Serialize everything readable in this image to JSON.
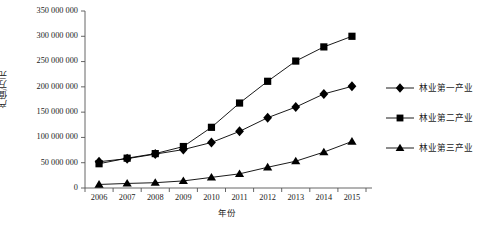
{
  "chart_data": {
    "type": "line",
    "title": "",
    "subtitle": "",
    "xlabel": "年份",
    "ylabel": "产值/万元",
    "categories": [
      "2006",
      "2007",
      "2008",
      "2009",
      "2010",
      "2011",
      "2012",
      "2013",
      "2014",
      "2015"
    ],
    "x": [
      2006,
      2007,
      2008,
      2009,
      2010,
      2011,
      2012,
      2013,
      2014,
      2015
    ],
    "xlim": [
      2005.5,
      2015.5
    ],
    "ylim": [
      0,
      350000000
    ],
    "ytick_values": [
      0,
      50000000,
      100000000,
      150000000,
      200000000,
      250000000,
      300000000,
      350000000
    ],
    "ytick_labels": [
      "0",
      "50 000 000",
      "100 000 000",
      "150 000 000",
      "200 000 000",
      "250 000 000",
      "300 000 000",
      "350 000 000"
    ],
    "grid": false,
    "legend_position": "right",
    "series": [
      {
        "name": "林业第一产业",
        "marker": "diamond",
        "color": "#000000",
        "values": [
          52000000,
          58000000,
          67000000,
          76000000,
          90000000,
          112000000,
          139000000,
          160000000,
          186000000,
          201000000
        ]
      },
      {
        "name": "林业第二产业",
        "marker": "square",
        "color": "#000000",
        "values": [
          48000000,
          59000000,
          68000000,
          82000000,
          120000000,
          168000000,
          211000000,
          251000000,
          279000000,
          300000000
        ]
      },
      {
        "name": "林业第三产业",
        "marker": "triangle",
        "color": "#000000",
        "values": [
          7000000,
          9000000,
          10500000,
          14000000,
          21000000,
          28000000,
          41000000,
          53000000,
          71000000,
          92000000
        ]
      }
    ]
  },
  "legend": {
    "items": [
      {
        "label": "林业第一产业",
        "marker": "diamond"
      },
      {
        "label": "林业第二产业",
        "marker": "square"
      },
      {
        "label": "林业第三产业",
        "marker": "triangle"
      }
    ]
  },
  "axes": {
    "y_title": "产值/万元",
    "x_title": "年份"
  }
}
